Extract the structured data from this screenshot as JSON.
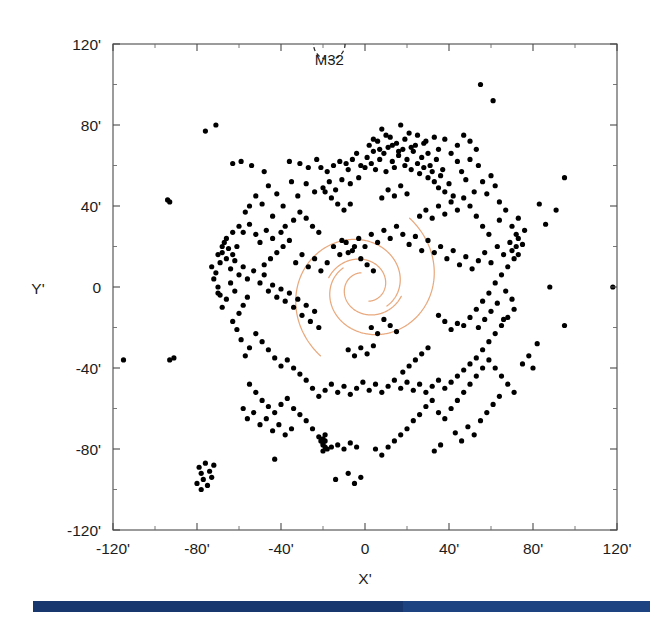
{
  "figure": {
    "background_color": "#ffffff",
    "frame_color": "#4a4a4a"
  },
  "chart_data": {
    "type": "scatter",
    "title": "",
    "xlabel": "X'",
    "ylabel": "Y'",
    "xlim": [
      -120,
      120
    ],
    "ylim": [
      -120,
      120
    ],
    "grid": false,
    "legend": null,
    "x_ticks": [
      -120,
      -80,
      -40,
      0,
      40,
      80,
      120
    ],
    "y_ticks": [
      -120,
      -80,
      -40,
      0,
      40,
      80,
      120
    ],
    "x_tick_labels": [
      "-120'",
      "-80'",
      "-40'",
      "0",
      "40'",
      "80'",
      "120'"
    ],
    "y_tick_labels": [
      "-120'",
      "-80'",
      "-40'",
      "0",
      "40'",
      "80'",
      "120'"
    ],
    "x_minor_step": 20,
    "y_minor_step": 20,
    "point_color": "#000000",
    "point_radius": 2.6,
    "annotations": [
      {
        "label": "M32",
        "x": -17,
        "y": 112,
        "marker": "dashed-circle",
        "marker_x": -17,
        "marker_y": 120,
        "marker_radius_arcmin": 7.5
      }
    ],
    "spiral_arms": {
      "color": "#e9a97e",
      "count": 4,
      "description": "Two pairs of logarithmic spiral arms tracing the M31 ring/arm structure",
      "arms": [
        {
          "name": "outer-arm-a",
          "theta_start_deg": 20,
          "theta_end_deg": 300,
          "r0": 13,
          "pitch_b": 0.215,
          "rotation_deg": 118
        },
        {
          "name": "outer-arm-b",
          "theta_start_deg": 20,
          "theta_end_deg": 300,
          "r0": 13,
          "pitch_b": 0.215,
          "rotation_deg": 298
        },
        {
          "name": "inner-arm-a",
          "theta_start_deg": 10,
          "theta_end_deg": 250,
          "r0": 7,
          "pitch_b": 0.215,
          "rotation_deg": 95
        },
        {
          "name": "inner-arm-b",
          "theta_start_deg": 10,
          "theta_end_deg": 250,
          "r0": 7,
          "pitch_b": 0.215,
          "rotation_deg": 275
        }
      ]
    },
    "points": [
      [
        55,
        100
      ],
      [
        61,
        92
      ],
      [
        95,
        54
      ],
      [
        83,
        41
      ],
      [
        -94,
        43
      ],
      [
        -93,
        42
      ],
      [
        -71,
        80
      ],
      [
        -76,
        77
      ],
      [
        -63,
        61
      ],
      [
        -59,
        62
      ],
      [
        -54,
        60
      ],
      [
        -48,
        57
      ],
      [
        -46,
        50
      ],
      [
        -42,
        46
      ],
      [
        -39,
        40
      ],
      [
        -36,
        62
      ],
      [
        -31,
        61
      ],
      [
        -27,
        59
      ],
      [
        -23,
        63
      ],
      [
        -21,
        59
      ],
      [
        -18,
        57
      ],
      [
        -15,
        60
      ],
      [
        -12,
        62
      ],
      [
        -9,
        61
      ],
      [
        -8,
        58
      ],
      [
        -6,
        63
      ],
      [
        -4,
        66
      ],
      [
        -2,
        60
      ],
      [
        0,
        59
      ],
      [
        1,
        64
      ],
      [
        2,
        70
      ],
      [
        3,
        61
      ],
      [
        4,
        67
      ],
      [
        5,
        58
      ],
      [
        6,
        72
      ],
      [
        7,
        63
      ],
      [
        8,
        78
      ],
      [
        9,
        66
      ],
      [
        10,
        57
      ],
      [
        11,
        69
      ],
      [
        12,
        74
      ],
      [
        13,
        62
      ],
      [
        14,
        59
      ],
      [
        15,
        71
      ],
      [
        16,
        65
      ],
      [
        17,
        80
      ],
      [
        18,
        68
      ],
      [
        19,
        60
      ],
      [
        20,
        63
      ],
      [
        21,
        76
      ],
      [
        22,
        58
      ],
      [
        23,
        67
      ],
      [
        24,
        70
      ],
      [
        25,
        61
      ],
      [
        26,
        56
      ],
      [
        27,
        64
      ],
      [
        28,
        59
      ],
      [
        29,
        72
      ],
      [
        30,
        54
      ],
      [
        31,
        60
      ],
      [
        32,
        57
      ],
      [
        33,
        52
      ],
      [
        34,
        63
      ],
      [
        35,
        49
      ],
      [
        36,
        55
      ],
      [
        37,
        58
      ],
      [
        38,
        47
      ],
      [
        40,
        51
      ],
      [
        42,
        45
      ],
      [
        44,
        62
      ],
      [
        46,
        57
      ],
      [
        48,
        53
      ],
      [
        50,
        63
      ],
      [
        52,
        47
      ],
      [
        54,
        60
      ],
      [
        56,
        52
      ],
      [
        58,
        46
      ],
      [
        60,
        55
      ],
      [
        62,
        50
      ],
      [
        64,
        42
      ],
      [
        50,
        72
      ],
      [
        53,
        68
      ],
      [
        47,
        75
      ],
      [
        44,
        70
      ],
      [
        41,
        66
      ],
      [
        38,
        73
      ],
      [
        35,
        68
      ],
      [
        33,
        74
      ],
      [
        30,
        66
      ],
      [
        28,
        71
      ],
      [
        25,
        75
      ],
      [
        22,
        69
      ],
      [
        19,
        73
      ],
      [
        16,
        67
      ],
      [
        13,
        70
      ],
      [
        10,
        75
      ],
      [
        7,
        68
      ],
      [
        4,
        73
      ],
      [
        -3,
        54
      ],
      [
        -7,
        51
      ],
      [
        -11,
        53
      ],
      [
        -14,
        48
      ],
      [
        -17,
        52
      ],
      [
        -20,
        49
      ],
      [
        -24,
        47
      ],
      [
        -28,
        51
      ],
      [
        -32,
        45
      ],
      [
        -35,
        52
      ],
      [
        -38,
        30
      ],
      [
        -40,
        27
      ],
      [
        -44,
        24
      ],
      [
        -47,
        28
      ],
      [
        -50,
        22
      ],
      [
        -52,
        26
      ],
      [
        -55,
        31
      ],
      [
        -58,
        27
      ],
      [
        -61,
        20
      ],
      [
        -63,
        16
      ],
      [
        -65,
        19
      ],
      [
        -66,
        14
      ],
      [
        -67,
        22
      ],
      [
        -68,
        17
      ],
      [
        -69,
        12
      ],
      [
        -64,
        9
      ],
      [
        -62,
        13
      ],
      [
        -60,
        6
      ],
      [
        -58,
        10
      ],
      [
        -56,
        4
      ],
      [
        -53,
        8
      ],
      [
        -50,
        2
      ],
      [
        -48,
        6
      ],
      [
        -46,
        -2
      ],
      [
        -44,
        1
      ],
      [
        -42,
        -5
      ],
      [
        -40,
        -1
      ],
      [
        -38,
        -7
      ],
      [
        -36,
        -3
      ],
      [
        -34,
        -10
      ],
      [
        -32,
        -6
      ],
      [
        -30,
        -14
      ],
      [
        -28,
        -9
      ],
      [
        -26,
        -17
      ],
      [
        -24,
        -12
      ],
      [
        -22,
        -20
      ],
      [
        -33,
        12
      ],
      [
        -30,
        16
      ],
      [
        -27,
        10
      ],
      [
        -24,
        14
      ],
      [
        -21,
        8
      ],
      [
        -18,
        12
      ],
      [
        -15,
        20
      ],
      [
        -12,
        16
      ],
      [
        -9,
        22
      ],
      [
        -6,
        18
      ],
      [
        -3,
        24
      ],
      [
        0,
        20
      ],
      [
        3,
        26
      ],
      [
        6,
        22
      ],
      [
        9,
        28
      ],
      [
        12,
        24
      ],
      [
        15,
        30
      ],
      [
        18,
        26
      ],
      [
        21,
        21
      ],
      [
        24,
        25
      ],
      [
        27,
        18
      ],
      [
        30,
        23
      ],
      [
        33,
        17
      ],
      [
        36,
        20
      ],
      [
        39,
        14
      ],
      [
        42,
        18
      ],
      [
        45,
        11
      ],
      [
        48,
        15
      ],
      [
        51,
        9
      ],
      [
        54,
        13
      ],
      [
        57,
        17
      ],
      [
        60,
        12
      ],
      [
        63,
        20
      ],
      [
        66,
        16
      ],
      [
        69,
        22
      ],
      [
        70,
        18
      ],
      [
        71,
        14
      ],
      [
        72,
        20
      ],
      [
        73,
        16
      ],
      [
        68,
        10
      ],
      [
        65,
        6
      ],
      [
        62,
        2
      ],
      [
        59,
        -3
      ],
      [
        56,
        -7
      ],
      [
        53,
        -11
      ],
      [
        50,
        -15
      ],
      [
        47,
        -19
      ],
      [
        44,
        -18
      ],
      [
        41,
        -21
      ],
      [
        38,
        -17
      ],
      [
        35,
        -14
      ],
      [
        67,
        -2
      ],
      [
        70,
        -6
      ],
      [
        71,
        -11
      ],
      [
        68,
        -15
      ],
      [
        65,
        -19
      ],
      [
        62,
        -23
      ],
      [
        59,
        -27
      ],
      [
        56,
        -31
      ],
      [
        53,
        -35
      ],
      [
        50,
        -38
      ],
      [
        47,
        -41
      ],
      [
        44,
        -44
      ],
      [
        41,
        -47
      ],
      [
        38,
        -50
      ],
      [
        35,
        -46
      ],
      [
        32,
        -49
      ],
      [
        29,
        -52
      ],
      [
        26,
        -48
      ],
      [
        23,
        -51
      ],
      [
        20,
        -47
      ],
      [
        17,
        -50
      ],
      [
        14,
        -46
      ],
      [
        11,
        -49
      ],
      [
        8,
        -52
      ],
      [
        5,
        -48
      ],
      [
        2,
        -51
      ],
      [
        -1,
        -47
      ],
      [
        -4,
        -50
      ],
      [
        -7,
        -53
      ],
      [
        -10,
        -49
      ],
      [
        -13,
        -52
      ],
      [
        -16,
        -48
      ],
      [
        -19,
        -51
      ],
      [
        -22,
        -54
      ],
      [
        -25,
        -50
      ],
      [
        -28,
        -46
      ],
      [
        -31,
        -43
      ],
      [
        -34,
        -40
      ],
      [
        -37,
        -36
      ],
      [
        -40,
        -39
      ],
      [
        -43,
        -35
      ],
      [
        -46,
        -31
      ],
      [
        -49,
        -27
      ],
      [
        -52,
        -23
      ],
      [
        -55,
        -30
      ],
      [
        -57,
        -34
      ],
      [
        -59,
        -26
      ],
      [
        -61,
        -21
      ],
      [
        -63,
        -17
      ],
      [
        -60,
        -13
      ],
      [
        -58,
        -9
      ],
      [
        -56,
        -5
      ],
      [
        -62,
        -2
      ],
      [
        -64,
        2
      ],
      [
        -66,
        -6
      ],
      [
        -68,
        -10
      ],
      [
        -70,
        -3
      ],
      [
        -55,
        -48
      ],
      [
        -52,
        -52
      ],
      [
        -49,
        -56
      ],
      [
        -46,
        -59
      ],
      [
        -43,
        -62
      ],
      [
        -40,
        -58
      ],
      [
        -37,
        -55
      ],
      [
        -34,
        -60
      ],
      [
        -31,
        -63
      ],
      [
        -28,
        -66
      ],
      [
        -25,
        -70
      ],
      [
        -22,
        -74
      ],
      [
        -20,
        -77
      ],
      [
        -19,
        -79
      ],
      [
        -20,
        -75
      ],
      [
        -19,
        -73
      ],
      [
        -20,
        -81
      ],
      [
        -19,
        -76
      ],
      [
        -20,
        -78
      ],
      [
        -18,
        -80
      ],
      [
        -21,
        -76
      ],
      [
        -16,
        -79
      ],
      [
        -13,
        -78
      ],
      [
        -10,
        -80
      ],
      [
        -7,
        -77
      ],
      [
        -4,
        -79
      ],
      [
        -35,
        -70
      ],
      [
        -38,
        -73
      ],
      [
        -41,
        -68
      ],
      [
        -44,
        -71
      ],
      [
        -47,
        -65
      ],
      [
        -50,
        -68
      ],
      [
        -53,
        -62
      ],
      [
        -56,
        -65
      ],
      [
        -58,
        -60
      ],
      [
        -72,
        -88
      ],
      [
        -74,
        -91
      ],
      [
        -76,
        -87
      ],
      [
        -78,
        -92
      ],
      [
        -77,
        -95
      ],
      [
        -75,
        -98
      ],
      [
        -73,
        -94
      ],
      [
        -79,
        -89
      ],
      [
        -80,
        -97
      ],
      [
        -78,
        -100
      ],
      [
        -43,
        -85
      ],
      [
        -14,
        -95
      ],
      [
        -8,
        -92
      ],
      [
        -5,
        -97
      ],
      [
        -2,
        -94
      ],
      [
        5,
        -80
      ],
      [
        8,
        -83
      ],
      [
        11,
        -79
      ],
      [
        14,
        -76
      ],
      [
        17,
        -73
      ],
      [
        20,
        -70
      ],
      [
        23,
        -66
      ],
      [
        26,
        -63
      ],
      [
        29,
        -59
      ],
      [
        32,
        -56
      ],
      [
        35,
        -62
      ],
      [
        38,
        -65
      ],
      [
        41,
        -60
      ],
      [
        44,
        -56
      ],
      [
        47,
        -52
      ],
      [
        50,
        -48
      ],
      [
        53,
        -44
      ],
      [
        56,
        -40
      ],
      [
        59,
        -36
      ],
      [
        62,
        -40
      ],
      [
        65,
        -44
      ],
      [
        68,
        -48
      ],
      [
        71,
        -52
      ],
      [
        43,
        -72
      ],
      [
        46,
        -76
      ],
      [
        49,
        -69
      ],
      [
        52,
        -73
      ],
      [
        55,
        -66
      ],
      [
        58,
        -62
      ],
      [
        61,
        -58
      ],
      [
        64,
        -54
      ],
      [
        33,
        -81
      ],
      [
        36,
        -78
      ],
      [
        -115,
        -36
      ],
      [
        -93,
        -36
      ],
      [
        -91,
        -35
      ],
      [
        118,
        0
      ],
      [
        95,
        -19
      ],
      [
        88,
        0
      ],
      [
        82,
        -28
      ],
      [
        78,
        -34
      ],
      [
        75,
        -38
      ],
      [
        80,
        -40
      ],
      [
        86,
        31
      ],
      [
        91,
        38
      ],
      [
        75,
        21
      ],
      [
        73,
        24
      ],
      [
        72,
        26
      ],
      [
        -63,
        27
      ],
      [
        -66,
        24
      ],
      [
        -60,
        30
      ],
      [
        -68,
        20
      ],
      [
        -70,
        16
      ],
      [
        26,
        35
      ],
      [
        29,
        38
      ],
      [
        32,
        34
      ],
      [
        35,
        40
      ],
      [
        38,
        36
      ],
      [
        41,
        42
      ],
      [
        44,
        38
      ],
      [
        47,
        44
      ],
      [
        50,
        40
      ],
      [
        53,
        35
      ],
      [
        56,
        30
      ],
      [
        59,
        26
      ],
      [
        -5,
        20
      ],
      [
        -8,
        17
      ],
      [
        -2,
        14
      ],
      [
        1,
        11
      ],
      [
        4,
        8
      ],
      [
        -11,
        23
      ],
      [
        15,
        -22
      ],
      [
        12,
        -19
      ],
      [
        9,
        -16
      ],
      [
        6,
        -23
      ],
      [
        3,
        -20
      ],
      [
        -45,
        14
      ],
      [
        -48,
        11
      ],
      [
        -42,
        17
      ],
      [
        -39,
        20
      ],
      [
        -36,
        23
      ],
      [
        24,
        -36
      ],
      [
        27,
        -33
      ],
      [
        30,
        -30
      ],
      [
        21,
        -39
      ],
      [
        18,
        -42
      ],
      [
        -71,
        7
      ],
      [
        -72,
        4
      ],
      [
        -70,
        0
      ],
      [
        -69,
        -4
      ],
      [
        -73,
        10
      ],
      [
        67,
        38
      ],
      [
        64,
        33
      ],
      [
        70,
        30
      ],
      [
        73,
        34
      ],
      [
        76,
        28
      ],
      [
        -28,
        34
      ],
      [
        -25,
        30
      ],
      [
        -22,
        27
      ],
      [
        -31,
        37
      ],
      [
        -34,
        33
      ],
      [
        8,
        44
      ],
      [
        11,
        48
      ],
      [
        14,
        45
      ],
      [
        17,
        50
      ],
      [
        20,
        46
      ],
      [
        -16,
        44
      ],
      [
        -13,
        41
      ],
      [
        -19,
        47
      ],
      [
        -10,
        38
      ],
      [
        -7,
        41
      ],
      [
        60,
        -12
      ],
      [
        63,
        -8
      ],
      [
        66,
        -16
      ],
      [
        57,
        -16
      ],
      [
        54,
        -20
      ],
      [
        -2,
        -30
      ],
      [
        1,
        -33
      ],
      [
        4,
        -29
      ],
      [
        -5,
        -34
      ],
      [
        -8,
        -31
      ],
      [
        -52,
        45
      ],
      [
        -49,
        41
      ],
      [
        -55,
        40
      ],
      [
        -57,
        37
      ],
      [
        -44,
        35
      ]
    ]
  },
  "bottom_bar": {
    "color_primary": "#17376e",
    "color_secondary": "#1d4380",
    "left": 33,
    "top": 601,
    "width": 617,
    "height": 11,
    "segment_split_x": 403
  }
}
